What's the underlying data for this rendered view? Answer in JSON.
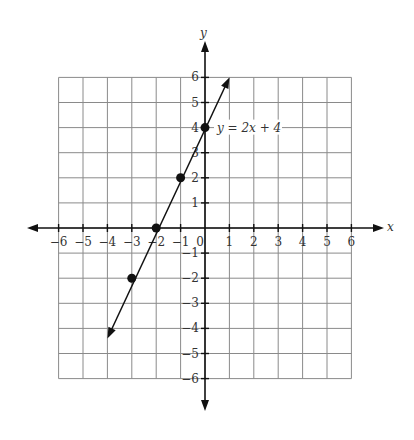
{
  "chart_data": {
    "type": "line",
    "title": "",
    "xlabel": "x",
    "ylabel": "y",
    "xlim": [
      -6,
      6
    ],
    "ylim": [
      -6,
      6
    ],
    "grid": true,
    "x_ticks": [
      "-6",
      "-5",
      "-4",
      "-3",
      "-2",
      "-1",
      "0",
      "1",
      "2",
      "3",
      "4",
      "5",
      "6"
    ],
    "y_ticks": [
      "-6",
      "-5",
      "-4",
      "-3",
      "-2",
      "-1",
      "1",
      "2",
      "3",
      "4",
      "5",
      "6"
    ],
    "series": [
      {
        "name": "y = 2x + 4",
        "equation": "y = 2x + 4",
        "line_from": [
          -4,
          -4.4
        ],
        "line_to": [
          1,
          6
        ],
        "points": [
          {
            "x": -3,
            "y": -2
          },
          {
            "x": -2,
            "y": 0
          },
          {
            "x": -1,
            "y": 2
          },
          {
            "x": 0,
            "y": 4
          }
        ]
      }
    ],
    "annotations": [
      {
        "text": "y = 2x + 4",
        "at": [
          0,
          4
        ]
      }
    ]
  },
  "labels": {
    "x_axis": "x",
    "y_axis": "y",
    "equation": "y = 2x + 4"
  },
  "colors": {
    "grid": "#8a8a8a",
    "axis": "#111111",
    "text": "#333333"
  }
}
